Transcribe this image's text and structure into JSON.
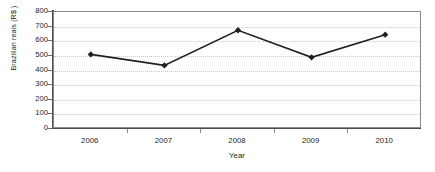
{
  "chart_data": {
    "type": "line",
    "title": "",
    "xlabel": "Year",
    "ylabel": "Brazilian reais (R$ )",
    "categories": [
      "2006",
      "2007",
      "2008",
      "2009",
      "2010"
    ],
    "values": [
      510,
      435,
      675,
      490,
      645
    ],
    "series": [
      {
        "name": "Brazilian reais (R$ )",
        "values": [
          510,
          435,
          675,
          490,
          645
        ],
        "marker": "diamond",
        "color": "#231f20"
      }
    ],
    "ylim": [
      0,
      800
    ],
    "yticks": [
      0,
      100,
      200,
      300,
      400,
      500,
      600,
      700,
      800
    ],
    "ytick_labels": [
      "0",
      "100",
      "200",
      "300",
      "400",
      "500",
      "600",
      "700",
      "800"
    ],
    "xtick_labels": [
      "2006",
      "2007",
      "2008",
      "2009",
      "2010"
    ],
    "grid": "horizontal-dotted",
    "legend": "none",
    "line_color": "#231f20",
    "grid_color": "#c9c9c9",
    "axis_color": "#4d4d4d",
    "background": "#ffffff"
  }
}
